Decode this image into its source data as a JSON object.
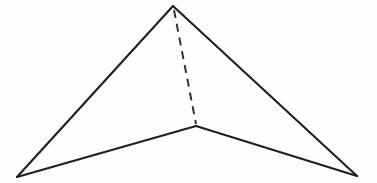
{
  "figure": {
    "name": "tetrahedron-wireframe",
    "background_color": "#fdfdfd",
    "stroke_color": "#1f1f1f",
    "hidden_stroke_color": "#2b2b2b",
    "face_fill": "none",
    "stroke_width": 2.1,
    "hidden_stroke_width": 1.9,
    "hidden_dash_pattern": "8 6",
    "canvas": {
      "width": 377,
      "height": 183
    },
    "vertices": [
      {
        "id": "apex",
        "label": "apex",
        "x": 173,
        "y": 6
      },
      {
        "id": "bottom-left",
        "label": "bottom left base",
        "x": 17,
        "y": 177
      },
      {
        "id": "bottom-right",
        "label": "bottom right base",
        "x": 357,
        "y": 176
      },
      {
        "id": "back",
        "label": "back base vertex",
        "x": 196,
        "y": 126
      }
    ],
    "edges": [
      {
        "id": "edge-apex-bottom-left",
        "from": "apex",
        "to": "bottom-left",
        "style": "solid",
        "path": "M 173 6 L 17 177"
      },
      {
        "id": "edge-apex-bottom-right",
        "from": "apex",
        "to": "bottom-right",
        "style": "solid",
        "path": "M 173 6 L 357 176"
      },
      {
        "id": "edge-bottom-left-back",
        "from": "bottom-left",
        "to": "back",
        "style": "solid",
        "path": "M 17 177 L 196 126"
      },
      {
        "id": "edge-back-bottom-right",
        "from": "back",
        "to": "bottom-right",
        "style": "solid",
        "path": "M 196 126 L 357 176"
      },
      {
        "id": "edge-apex-back",
        "from": "apex",
        "to": "back",
        "style": "dashed",
        "path": "M 174 10 L 196 124"
      }
    ]
  }
}
